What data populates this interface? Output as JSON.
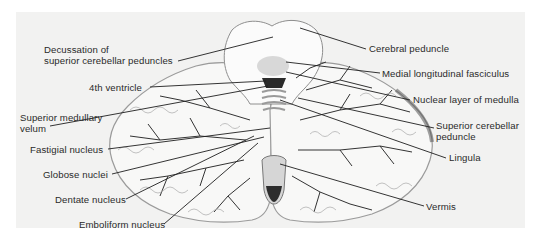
{
  "figure": {
    "colors": {
      "panel": "#f2f2f1",
      "tissue": "#fafafa",
      "outline": "#9a9a9a",
      "white_matter_lines": "#2e2e2e",
      "leader_lines": "#1e1e1e",
      "dark_nucleus": "#2b2b2b",
      "text": "#2a2a2a"
    },
    "labels_left": [
      {
        "id": "decussation",
        "line1": "Decussation of",
        "line2": "superior cerebellar peduncles"
      },
      {
        "id": "fourth-ventricle",
        "line1": "4th ventricle"
      },
      {
        "id": "superior-medullary-velum",
        "line1": "Superior medullary",
        "line2": "velum"
      },
      {
        "id": "fastigial-nucleus",
        "line1": "Fastigial nucleus"
      },
      {
        "id": "globose-nuclei",
        "line1": "Globose nuclei"
      },
      {
        "id": "dentate-nucleus",
        "line1": "Dentate nucleus"
      },
      {
        "id": "emboliform-nucleus",
        "line1": "Emboliform nucleus"
      }
    ],
    "labels_right": [
      {
        "id": "cerebral-peduncle",
        "line1": "Cerebral peduncle"
      },
      {
        "id": "medial-longitudinal-fasciculus",
        "line1": "Medial longitudinal fasciculus"
      },
      {
        "id": "nuclear-layer-of-medulla",
        "line1": "Nuclear layer of medulla"
      },
      {
        "id": "superior-cerebellar-peduncle",
        "line1": "Superior cerebellar",
        "line2": "peduncle"
      },
      {
        "id": "lingula",
        "line1": "Lingula"
      },
      {
        "id": "vermis",
        "line1": "Vermis"
      }
    ]
  }
}
